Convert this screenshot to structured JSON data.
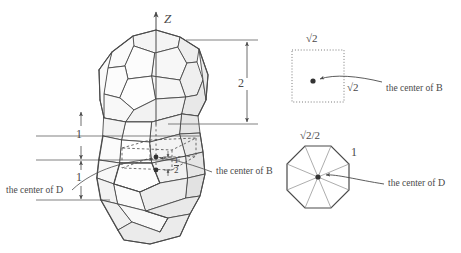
{
  "figure": {
    "stroke": "#4a4a4a",
    "face_light": "#fcfcfc",
    "face_mid": "#f0f0f0",
    "face_dark": "#e4e4e4",
    "dot_color": "#333333"
  },
  "axis": {
    "z_label": "Z"
  },
  "dimensions": {
    "right_height": "2",
    "left_upper": "1",
    "left_lower": "1",
    "inner_half_num": "1",
    "inner_half_den": "2"
  },
  "captions": {
    "left_center_d": "the center of D",
    "left_center_d_prefix": "the center of ",
    "left_center_d_symbol": "D",
    "mid_center_b": "the center of ",
    "mid_center_b_symbol": "B",
    "inset_top_center_b": "the center of ",
    "inset_top_center_b_symbol": "B",
    "inset_bottom_center_d": "the center of ",
    "inset_bottom_center_d_symbol": "D"
  },
  "inset_square": {
    "top_label_radical": "√2",
    "right_label_radical": "√2",
    "style": "dotted"
  },
  "inset_octagon": {
    "top_label": "√2/2",
    "edge_label": "1",
    "spokes": 8
  }
}
